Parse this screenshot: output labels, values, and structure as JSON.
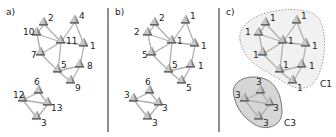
{
  "panels": [
    {
      "id": "a",
      "label": "a)",
      "nodes": [
        {
          "id": "n2",
          "x": 44,
          "y": 24,
          "value": "2",
          "lx": 48,
          "ly": 21
        },
        {
          "id": "n4",
          "x": 75,
          "y": 22,
          "value": "4",
          "lx": 79,
          "ly": 19
        },
        {
          "id": "n10",
          "x": 37,
          "y": 34,
          "value": "10",
          "lx": 23,
          "ly": 35
        },
        {
          "id": "n11",
          "x": 61,
          "y": 42,
          "value": "11",
          "lx": 66,
          "ly": 44
        },
        {
          "id": "n1",
          "x": 84,
          "y": 45,
          "value": "1",
          "lx": 90,
          "ly": 49
        },
        {
          "id": "n7",
          "x": 41,
          "y": 54,
          "value": "7",
          "lx": 31,
          "ly": 58
        },
        {
          "id": "n5",
          "x": 58,
          "y": 71,
          "value": "5",
          "lx": 61,
          "ly": 68
        },
        {
          "id": "n8",
          "x": 80,
          "y": 66,
          "value": "8",
          "lx": 87,
          "ly": 69
        },
        {
          "id": "n9",
          "x": 71,
          "y": 82,
          "value": "9",
          "lx": 75,
          "ly": 91
        },
        {
          "id": "n6",
          "x": 39,
          "y": 92,
          "value": "6",
          "lx": 34,
          "ly": 85
        },
        {
          "id": "n12",
          "x": 23,
          "y": 100,
          "value": "12",
          "lx": 13,
          "ly": 98
        },
        {
          "id": "n13",
          "x": 48,
          "y": 104,
          "value": "13",
          "lx": 51,
          "ly": 111
        },
        {
          "id": "n3",
          "x": 37,
          "y": 118,
          "value": "3",
          "lx": 41,
          "ly": 126
        }
      ]
    },
    {
      "id": "b",
      "label": "b)",
      "nodes": [
        {
          "id": "n2",
          "value": "2"
        },
        {
          "id": "n4",
          "value": "1"
        },
        {
          "id": "n10",
          "value": "2"
        },
        {
          "id": "n11",
          "value": "1"
        },
        {
          "id": "n1",
          "value": "1"
        },
        {
          "id": "n7",
          "value": "5"
        },
        {
          "id": "n5",
          "value": "5"
        },
        {
          "id": "n8",
          "value": "1"
        },
        {
          "id": "n9",
          "value": "5"
        },
        {
          "id": "n6",
          "value": "6"
        },
        {
          "id": "n12",
          "value": "3"
        },
        {
          "id": "n13",
          "value": "3"
        },
        {
          "id": "n3",
          "value": "3"
        }
      ]
    },
    {
      "id": "c",
      "label": "c)",
      "nodes": [
        {
          "id": "n2",
          "value": "1"
        },
        {
          "id": "n4",
          "value": "1"
        },
        {
          "id": "n10",
          "value": "1"
        },
        {
          "id": "n11",
          "value": "1"
        },
        {
          "id": "n1",
          "value": "1"
        },
        {
          "id": "n7",
          "value": "1"
        },
        {
          "id": "n5",
          "value": "1"
        },
        {
          "id": "n8",
          "value": "1"
        },
        {
          "id": "n9",
          "value": "1"
        },
        {
          "id": "n6",
          "value": "3"
        },
        {
          "id": "n12",
          "value": "3"
        },
        {
          "id": "n13",
          "value": "3"
        },
        {
          "id": "n3",
          "value": "3"
        }
      ],
      "clusters": [
        {
          "id": "C1",
          "label": "C1",
          "fill": "#f1f1f1",
          "stroke": "#888888",
          "dashed": true
        },
        {
          "id": "C3",
          "label": "C3",
          "fill": "#d6d6d6",
          "stroke": "#666666",
          "dashed": false
        }
      ]
    }
  ],
  "edges": [
    [
      "n2",
      "n10"
    ],
    [
      "n2",
      "n11"
    ],
    [
      "n10",
      "n11"
    ],
    [
      "n10",
      "n7"
    ],
    [
      "n7",
      "n11"
    ],
    [
      "n7",
      "n5"
    ],
    [
      "n11",
      "n5"
    ],
    [
      "n11",
      "n4"
    ],
    [
      "n4",
      "n1"
    ],
    [
      "n11",
      "n1"
    ],
    [
      "n1",
      "n8"
    ],
    [
      "n5",
      "n8"
    ],
    [
      "n5",
      "n9"
    ],
    [
      "n8",
      "n9"
    ],
    [
      "n6",
      "n12"
    ],
    [
      "n6",
      "n13"
    ],
    [
      "n12",
      "n13"
    ],
    [
      "n12",
      "n3"
    ],
    [
      "n13",
      "n3"
    ]
  ],
  "colors": {
    "edge": "#b0b0b0",
    "node_light": "#c8c8c8",
    "node_dark": "#7a7a7a",
    "divider": "#444444",
    "text": "#222222"
  }
}
